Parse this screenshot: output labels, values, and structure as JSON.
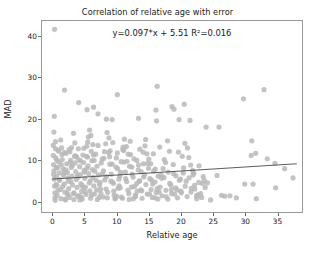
{
  "chart_data": {
    "type": "scatter",
    "title": "Correlation of relative age with error",
    "xlabel": "Relative age",
    "ylabel": "MAD",
    "annotation": "y=0.097*x + 5.51 R²=0.016",
    "grid": false,
    "legend": null,
    "xlim": [
      -1.6,
      38.8
    ],
    "ylim": [
      -2.4,
      43.5
    ],
    "xticks": [
      0,
      5,
      10,
      15,
      20,
      25,
      30,
      35
    ],
    "yticks": [
      0,
      10,
      20,
      30,
      40
    ],
    "point_color": "#b9b9b9",
    "line_color": "#4a4a4a",
    "axes_color": "#9a9a9a",
    "fit": {
      "slope": 0.097,
      "intercept": 5.51,
      "r_squared": 0.016,
      "x_start": 0.0,
      "x_end": 38.0
    },
    "points": [
      [
        0.35,
        41.5
      ],
      [
        0.3,
        20.6
      ],
      [
        0.25,
        16.8
      ],
      [
        1.9,
        26.9
      ],
      [
        4.1,
        23.9
      ],
      [
        5.4,
        22.2
      ],
      [
        6.4,
        22.8
      ],
      [
        7.1,
        21.2
      ],
      [
        8.4,
        19.9
      ],
      [
        9.3,
        19.8
      ],
      [
        10.1,
        25.8
      ],
      [
        13.4,
        20.1
      ],
      [
        16.3,
        27.8
      ],
      [
        16.1,
        22.1
      ],
      [
        16.2,
        19.5
      ],
      [
        18.6,
        22.9
      ],
      [
        18.9,
        22.3
      ],
      [
        20.5,
        23.5
      ],
      [
        19.7,
        19.8
      ],
      [
        21.4,
        19.6
      ],
      [
        23.9,
        18.0
      ],
      [
        25.9,
        18.0
      ],
      [
        29.7,
        24.8
      ],
      [
        32.9,
        27.0
      ],
      [
        31.0,
        14.7
      ],
      [
        31.6,
        11.7
      ],
      [
        30.9,
        11.2
      ],
      [
        33.4,
        10.4
      ],
      [
        34.6,
        9.3
      ],
      [
        36.1,
        8.0
      ],
      [
        37.4,
        5.8
      ],
      [
        34.7,
        3.4
      ],
      [
        31.7,
        0.8
      ],
      [
        31.2,
        4.3
      ],
      [
        29.9,
        4.3
      ],
      [
        28.6,
        1.0
      ],
      [
        27.6,
        1.5
      ],
      [
        26.8,
        1.4
      ],
      [
        26.3,
        1.6
      ],
      [
        25.6,
        6.4
      ],
      [
        24.6,
        0.5
      ],
      [
        24.1,
        4.6
      ],
      [
        23.6,
        5.2
      ],
      [
        23.2,
        1.1
      ],
      [
        22.6,
        1.7
      ],
      [
        22.1,
        4.0
      ],
      [
        21.8,
        7.6
      ],
      [
        21.5,
        8.9
      ],
      [
        21.0,
        13.0
      ],
      [
        20.6,
        14.1
      ],
      [
        20.2,
        11.0
      ],
      [
        19.9,
        5.5
      ],
      [
        19.4,
        2.9
      ],
      [
        19.0,
        1.9
      ],
      [
        18.5,
        3.0
      ],
      [
        18.2,
        12.2
      ],
      [
        17.9,
        14.7
      ],
      [
        17.6,
        9.5
      ],
      [
        17.2,
        8.0
      ],
      [
        16.9,
        6.5
      ],
      [
        16.6,
        2.4
      ],
      [
        16.4,
        0.7
      ],
      [
        16.0,
        1.0
      ],
      [
        15.6,
        4.3
      ],
      [
        15.3,
        9.2
      ],
      [
        15.0,
        10.3
      ],
      [
        14.7,
        11.6
      ],
      [
        14.4,
        13.5
      ],
      [
        14.1,
        12.0
      ],
      [
        13.8,
        7.3
      ],
      [
        13.5,
        5.0
      ],
      [
        13.2,
        2.6
      ],
      [
        12.9,
        1.3
      ],
      [
        12.6,
        0.8
      ],
      [
        12.3,
        3.6
      ],
      [
        12.0,
        8.6
      ],
      [
        11.8,
        11.5
      ],
      [
        11.5,
        13.3
      ],
      [
        11.2,
        15.1
      ],
      [
        11.0,
        13.2
      ],
      [
        10.7,
        9.7
      ],
      [
        10.5,
        6.2
      ],
      [
        10.2,
        3.3
      ],
      [
        10.0,
        1.4
      ],
      [
        9.8,
        0.9
      ],
      [
        9.5,
        4.5
      ],
      [
        9.3,
        9.1
      ],
      [
        9.0,
        12.3
      ],
      [
        8.8,
        15.4
      ],
      [
        8.5,
        16.7
      ],
      [
        8.3,
        14.0
      ],
      [
        8.0,
        10.5
      ],
      [
        7.8,
        6.8
      ],
      [
        7.5,
        3.1
      ],
      [
        7.3,
        1.1
      ],
      [
        7.0,
        0.6
      ],
      [
        6.8,
        5.2
      ],
      [
        6.5,
        10.0
      ],
      [
        6.3,
        13.8
      ],
      [
        6.0,
        16.0
      ],
      [
        5.8,
        17.3
      ],
      [
        5.5,
        14.4
      ],
      [
        5.3,
        11.0
      ],
      [
        5.0,
        7.2
      ],
      [
        4.8,
        3.4
      ],
      [
        4.5,
        1.2
      ],
      [
        4.3,
        0.5
      ],
      [
        4.0,
        6.0
      ],
      [
        3.8,
        10.8
      ],
      [
        3.5,
        14.2
      ],
      [
        3.3,
        16.5
      ],
      [
        3.0,
        13.1
      ],
      [
        2.8,
        9.6
      ],
      [
        2.5,
        5.8
      ],
      [
        2.3,
        2.1
      ],
      [
        2.0,
        0.7
      ],
      [
        1.8,
        7.0
      ],
      [
        1.5,
        11.4
      ],
      [
        1.3,
        14.9
      ],
      [
        1.0,
        12.2
      ],
      [
        0.8,
        8.3
      ],
      [
        0.6,
        4.2
      ],
      [
        0.4,
        1.0
      ],
      [
        0.2,
        6.6
      ],
      [
        0.5,
        12.8
      ],
      [
        0.7,
        10.1
      ],
      [
        0.9,
        2.8
      ],
      [
        1.1,
        5.4
      ],
      [
        1.4,
        9.0
      ],
      [
        1.6,
        3.7
      ],
      [
        1.9,
        11.9
      ],
      [
        2.1,
        7.7
      ],
      [
        2.4,
        1.8
      ],
      [
        2.6,
        12.6
      ],
      [
        2.9,
        4.9
      ],
      [
        3.1,
        8.8
      ],
      [
        3.4,
        2.2
      ],
      [
        3.6,
        11.1
      ],
      [
        3.9,
        6.3
      ],
      [
        4.1,
        1.5
      ],
      [
        4.4,
        9.9
      ],
      [
        4.6,
        4.0
      ],
      [
        4.9,
        12.9
      ],
      [
        5.1,
        2.5
      ],
      [
        5.4,
        8.1
      ],
      [
        5.6,
        15.6
      ],
      [
        5.9,
        5.1
      ],
      [
        6.1,
        1.7
      ],
      [
        6.4,
        11.3
      ],
      [
        6.6,
        7.4
      ],
      [
        6.9,
        2.9
      ],
      [
        7.1,
        13.6
      ],
      [
        7.4,
        4.7
      ],
      [
        7.6,
        9.4
      ],
      [
        7.9,
        1.2
      ],
      [
        8.1,
        12.1
      ],
      [
        8.4,
        6.1
      ],
      [
        8.6,
        2.3
      ],
      [
        8.9,
        10.9
      ],
      [
        9.1,
        5.0
      ],
      [
        9.4,
        14.3
      ],
      [
        9.6,
        1.6
      ],
      [
        9.9,
        8.4
      ],
      [
        10.1,
        11.8
      ],
      [
        10.4,
        3.9
      ],
      [
        10.6,
        7.1
      ],
      [
        10.9,
        0.9
      ],
      [
        11.1,
        12.4
      ],
      [
        11.4,
        5.6
      ],
      [
        11.6,
        9.8
      ],
      [
        11.9,
        2.0
      ],
      [
        12.1,
        14.6
      ],
      [
        12.4,
        6.7
      ],
      [
        12.7,
        10.4
      ],
      [
        12.9,
        1.4
      ],
      [
        13.1,
        4.4
      ],
      [
        13.4,
        8.9
      ],
      [
        13.6,
        12.7
      ],
      [
        13.9,
        2.7
      ],
      [
        14.2,
        6.0
      ],
      [
        14.5,
        15.0
      ],
      [
        14.8,
        9.3
      ],
      [
        15.1,
        1.9
      ],
      [
        15.4,
        5.3
      ],
      [
        15.7,
        11.6
      ],
      [
        16.0,
        7.9
      ],
      [
        16.3,
        3.2
      ],
      [
        16.7,
        13.2
      ],
      [
        17.0,
        5.7
      ],
      [
        17.4,
        10.2
      ],
      [
        17.7,
        1.3
      ],
      [
        18.0,
        7.2
      ],
      [
        18.4,
        4.1
      ],
      [
        18.8,
        9.0
      ],
      [
        19.2,
        6.3
      ],
      [
        19.6,
        12.0
      ],
      [
        20.0,
        2.6
      ],
      [
        20.4,
        8.2
      ],
      [
        20.8,
        5.0
      ],
      [
        21.2,
        10.7
      ],
      [
        21.6,
        3.3
      ],
      [
        22.0,
        6.9
      ],
      [
        22.4,
        1.5
      ],
      [
        22.8,
        8.7
      ],
      [
        23.3,
        4.5
      ],
      [
        0.15,
        13.6
      ],
      [
        0.15,
        11.2
      ],
      [
        0.2,
        9.0
      ],
      [
        0.25,
        7.4
      ],
      [
        0.3,
        5.5
      ],
      [
        0.35,
        3.8
      ],
      [
        0.4,
        2.2
      ],
      [
        0.45,
        0.4
      ],
      [
        0.5,
        14.5
      ],
      [
        0.55,
        10.6
      ],
      [
        0.6,
        8.2
      ],
      [
        0.65,
        6.1
      ],
      [
        0.7,
        4.0
      ],
      [
        0.75,
        1.6
      ],
      [
        0.85,
        12.5
      ],
      [
        0.95,
        9.7
      ],
      [
        1.05,
        7.0
      ],
      [
        1.15,
        5.2
      ],
      [
        1.25,
        3.0
      ],
      [
        1.35,
        0.8
      ],
      [
        1.45,
        13.0
      ],
      [
        1.55,
        10.2
      ],
      [
        1.65,
        8.0
      ],
      [
        1.75,
        6.4
      ],
      [
        1.85,
        4.3
      ],
      [
        1.95,
        2.4
      ],
      [
        2.05,
        0.5
      ],
      [
        2.15,
        11.7
      ],
      [
        2.25,
        9.2
      ],
      [
        2.35,
        7.1
      ],
      [
        2.45,
        5.0
      ],
      [
        2.55,
        3.2
      ],
      [
        2.65,
        1.1
      ],
      [
        2.75,
        12.1
      ],
      [
        2.85,
        10.0
      ],
      [
        2.95,
        8.3
      ],
      [
        3.05,
        6.2
      ],
      [
        3.15,
        4.1
      ],
      [
        3.25,
        2.0
      ],
      [
        3.35,
        0.6
      ],
      [
        3.45,
        11.0
      ],
      [
        3.55,
        9.4
      ],
      [
        3.65,
        7.3
      ],
      [
        3.75,
        5.4
      ],
      [
        3.85,
        3.5
      ],
      [
        3.95,
        1.4
      ],
      [
        4.05,
        12.8
      ],
      [
        4.15,
        10.1
      ],
      [
        4.25,
        8.5
      ],
      [
        4.35,
        6.6
      ],
      [
        4.45,
        4.4
      ],
      [
        4.55,
        2.5
      ],
      [
        4.65,
        0.7
      ],
      [
        4.75,
        11.3
      ],
      [
        4.85,
        9.5
      ],
      [
        4.95,
        7.6
      ],
      [
        5.05,
        5.7
      ],
      [
        5.15,
        3.6
      ],
      [
        5.25,
        1.8
      ],
      [
        5.35,
        13.4
      ],
      [
        5.45,
        10.8
      ],
      [
        5.55,
        8.7
      ],
      [
        5.65,
        6.8
      ],
      [
        5.75,
        4.6
      ],
      [
        5.85,
        2.7
      ],
      [
        5.95,
        0.9
      ],
      [
        6.05,
        12.2
      ],
      [
        6.15,
        9.9
      ],
      [
        6.25,
        7.8
      ],
      [
        6.35,
        5.9
      ],
      [
        6.45,
        3.9
      ],
      [
        6.55,
        1.9
      ],
      [
        6.75,
        11.5
      ],
      [
        6.95,
        8.6
      ],
      [
        7.15,
        6.5
      ],
      [
        7.35,
        4.2
      ],
      [
        7.55,
        2.1
      ],
      [
        7.75,
        10.3
      ],
      [
        7.95,
        7.5
      ],
      [
        8.15,
        5.3
      ],
      [
        8.35,
        3.1
      ],
      [
        8.55,
        1.0
      ],
      [
        8.75,
        11.9
      ],
      [
        8.95,
        9.1
      ],
      [
        9.15,
        6.7
      ],
      [
        9.35,
        4.8
      ],
      [
        9.55,
        2.6
      ],
      [
        9.75,
        0.8
      ],
      [
        9.95,
        10.6
      ],
      [
        10.15,
        8.0
      ],
      [
        10.35,
        5.5
      ],
      [
        10.55,
        3.4
      ],
      [
        10.75,
        1.2
      ],
      [
        10.95,
        12.6
      ],
      [
        11.15,
        9.6
      ],
      [
        11.35,
        7.2
      ],
      [
        11.55,
        4.9
      ],
      [
        11.75,
        2.8
      ],
      [
        11.95,
        0.6
      ],
      [
        12.15,
        11.4
      ],
      [
        12.35,
        8.4
      ],
      [
        12.55,
        6.0
      ],
      [
        12.75,
        3.7
      ],
      [
        12.95,
        1.7
      ],
      [
        13.15,
        10.0
      ],
      [
        13.35,
        7.7
      ],
      [
        13.55,
        5.1
      ],
      [
        13.75,
        2.9
      ],
      [
        13.95,
        0.9
      ],
      [
        14.15,
        9.2
      ],
      [
        14.35,
        6.6
      ],
      [
        14.55,
        4.2
      ],
      [
        14.75,
        1.9
      ],
      [
        14.95,
        8.1
      ],
      [
        15.15,
        5.6
      ],
      [
        15.35,
        3.0
      ],
      [
        15.55,
        1.1
      ],
      [
        15.75,
        7.4
      ],
      [
        15.95,
        4.8
      ],
      [
        16.15,
        2.3
      ],
      [
        16.45,
        6.2
      ],
      [
        16.75,
        3.6
      ],
      [
        17.05,
        1.5
      ],
      [
        17.35,
        5.9
      ],
      [
        17.65,
        2.8
      ],
      [
        17.95,
        0.7
      ],
      [
        18.25,
        4.5
      ],
      [
        18.55,
        2.0
      ],
      [
        18.85,
        6.8
      ],
      [
        19.15,
        3.4
      ],
      [
        19.45,
        1.0
      ],
      [
        19.75,
        5.2
      ],
      [
        20.05,
        2.2
      ],
      [
        20.35,
        7.0
      ],
      [
        20.65,
        3.8
      ],
      [
        20.95,
        1.3
      ],
      [
        21.25,
        5.8
      ],
      [
        21.55,
        2.4
      ],
      [
        21.85,
        6.5
      ],
      [
        22.15,
        3.1
      ],
      [
        22.45,
        0.8
      ],
      [
        22.75,
        4.7
      ],
      [
        23.05,
        2.0
      ],
      [
        23.45,
        6.1
      ],
      [
        23.75,
        3.5
      ]
    ]
  }
}
